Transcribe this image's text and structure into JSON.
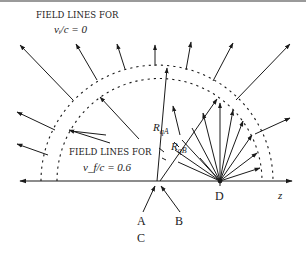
{
  "diagram": {
    "title_top_line1": "FIELD LINES FOR",
    "title_top_line2": "v_i/c = 0",
    "title_top_line2_display": "vᵢ/c = 0",
    "title_bottom_line1": "FIELD LINES FOR",
    "title_bottom_line2_display": "v_f/c = 0.6",
    "label_RqA_main": "R",
    "label_RqA_sub": "qA",
    "label_RqB_main": "R",
    "label_RqB_sub": "qB",
    "axis_label": "z",
    "points": {
      "A": "A",
      "B": "B",
      "C": "C",
      "D": "D"
    },
    "colors": {
      "ink": "#1a1a1a",
      "background": "#ffffff"
    }
  }
}
